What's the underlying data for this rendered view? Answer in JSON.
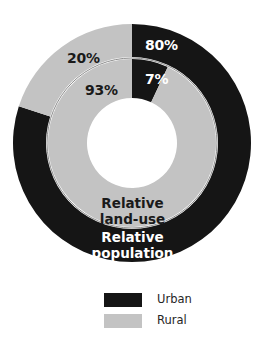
{
  "chart_data": {
    "type": "pie",
    "title": "",
    "subtitle": "",
    "xlabel": "",
    "ylabel": "",
    "legend_position": "bottom",
    "grid": false,
    "rings": [
      {
        "name": "Relative population",
        "position": "outer",
        "caption": "Relative\npopulation",
        "caption_line1": "Relative",
        "caption_line2": "population",
        "categories": [
          "Urban",
          "Rural"
        ],
        "values": [
          80,
          20
        ],
        "labels": [
          "80%",
          "20%"
        ]
      },
      {
        "name": "Relative land-use",
        "position": "inner",
        "caption": "Relative\nland-use",
        "caption_line1": "Relative",
        "caption_line2": "land-use",
        "categories": [
          "Urban",
          "Rural"
        ],
        "values": [
          7,
          93
        ],
        "labels": [
          "7%",
          "93%"
        ]
      }
    ],
    "legend": [
      {
        "label": "Urban",
        "color": "#151515"
      },
      {
        "label": "Rural",
        "color": "#c3c3c3"
      }
    ],
    "colors": {
      "urban": "#151515",
      "rural": "#c3c3c3",
      "background": "#ffffff",
      "separator": "#8c8c8c"
    }
  },
  "geometry": {
    "center_x": 132,
    "center_y": 143,
    "outer_ring_outer_radius": 119,
    "outer_ring_inner_radius": 86,
    "inner_ring_outer_radius": 84,
    "inner_ring_inner_radius": 45
  }
}
